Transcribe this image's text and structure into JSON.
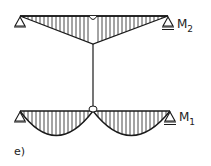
{
  "diagram": {
    "labels": {
      "top_moment": "M",
      "top_moment_sub": "2",
      "bottom_moment": "M",
      "bottom_moment_sub": "1",
      "figure_label": "e)"
    },
    "colors": {
      "line": "#1a1a1a",
      "background": "#ffffff"
    },
    "elements": {
      "top_beam": "Simply supported beam with triangular bending moment diagram, hinge at midspan",
      "connecting_rod": "Vertical rod linking the midspans of the two beams",
      "bottom_beam": "Simply supported beam with a double-lobed parabolic moment diagram, hinge at midspan"
    }
  }
}
